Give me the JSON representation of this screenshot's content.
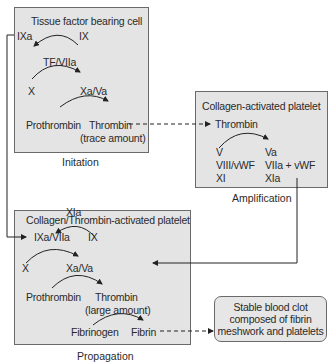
{
  "initiation": {
    "title": "Tissue factor bearing cell",
    "ixa": "IXa",
    "ix": "IX",
    "tf": "TF/VIIa",
    "x": "X",
    "xava": "Xa/Va",
    "prothrombin": "Prothrombin",
    "thrombin": "Thrombin",
    "trace": "(trace amount)",
    "label": "Initation"
  },
  "amplification": {
    "title": "Collagen-activated platelet",
    "thrombin": "Thrombin",
    "v": "V",
    "va": "Va",
    "viii": "VIII/vWF",
    "viia": "VIIa + vWF",
    "xi": "XI",
    "xia": "XIa",
    "label": "Amplification"
  },
  "propagation": {
    "title": "Collagen/Thrombin-activated platelet",
    "xia": "XIa",
    "ixavii": "IXa/VIIa",
    "ix": "IX",
    "x": "X",
    "xava": "Xa/Va",
    "prothrombin": "Prothrombin",
    "thrombin": "Thrombin",
    "large": "(large amount)",
    "fibrinogen": "Fibrinogen",
    "fibrin": "Fibrin",
    "label": "Propagation"
  },
  "clot": {
    "line1": "Stable blood clot",
    "line2": "composed of fibrin",
    "line3": "meshwork and platelets"
  }
}
